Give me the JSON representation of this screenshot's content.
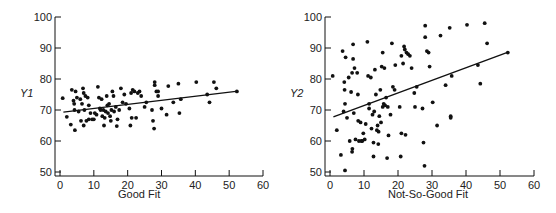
{
  "chart_data": [
    {
      "type": "scatter",
      "title": "",
      "xlabel": "Good Fit",
      "ylabel": "Y1",
      "xlim": [
        0,
        60
      ],
      "ylim": [
        50,
        100
      ],
      "xticks": [
        0,
        10,
        20,
        30,
        40,
        50,
        60
      ],
      "yticks": [
        50,
        60,
        70,
        80,
        90,
        100
      ],
      "grid": false,
      "legend": null,
      "fit_line": {
        "x": [
          1,
          52
        ],
        "y": [
          69.3,
          76
        ]
      },
      "points": [
        [
          0.8,
          73.8
        ],
        [
          2,
          67.8
        ],
        [
          3.2,
          65.3
        ],
        [
          3.5,
          76.5
        ],
        [
          4,
          73
        ],
        [
          4.2,
          72
        ],
        [
          4.3,
          70
        ],
        [
          4.4,
          63.5
        ],
        [
          4.6,
          76
        ],
        [
          5,
          74
        ],
        [
          5.5,
          69.5
        ],
        [
          6,
          73.5
        ],
        [
          6.2,
          66.5
        ],
        [
          6.5,
          72
        ],
        [
          6.8,
          77
        ],
        [
          7,
          75.5
        ],
        [
          7,
          65
        ],
        [
          7.2,
          70
        ],
        [
          7.5,
          74.5
        ],
        [
          7.8,
          66.5
        ],
        [
          8.2,
          74
        ],
        [
          8.5,
          71.5
        ],
        [
          8.5,
          67
        ],
        [
          9,
          69
        ],
        [
          9.5,
          67
        ],
        [
          10,
          67
        ],
        [
          10.3,
          69
        ],
        [
          10.8,
          68.5
        ],
        [
          11.2,
          77.5
        ],
        [
          11.5,
          74
        ],
        [
          11.8,
          70.5
        ],
        [
          12,
          70
        ],
        [
          12.3,
          73.5
        ],
        [
          12.5,
          68
        ],
        [
          12.8,
          70
        ],
        [
          13,
          65
        ],
        [
          13.2,
          67.5
        ],
        [
          13.5,
          69.5
        ],
        [
          13.8,
          74.5
        ],
        [
          14,
          71.5
        ],
        [
          14.2,
          69
        ],
        [
          14.5,
          72
        ],
        [
          14.8,
          68
        ],
        [
          15,
          66.5
        ],
        [
          15.2,
          70
        ],
        [
          15.5,
          76
        ],
        [
          15.8,
          74.5
        ],
        [
          16,
          69.5
        ],
        [
          16.5,
          71
        ],
        [
          16.8,
          64.8
        ],
        [
          17,
          67
        ],
        [
          17.5,
          70
        ],
        [
          18,
          77
        ],
        [
          18.5,
          72.5
        ],
        [
          19,
          75
        ],
        [
          19.5,
          72
        ],
        [
          20.5,
          70.5
        ],
        [
          20.8,
          65
        ],
        [
          21,
          75.5
        ],
        [
          21.2,
          67.5
        ],
        [
          21.5,
          76.5
        ],
        [
          22,
          76
        ],
        [
          22.5,
          67.5
        ],
        [
          23,
          75.5
        ],
        [
          23.5,
          76
        ],
        [
          24,
          74.5
        ],
        [
          25,
          71
        ],
        [
          25.5,
          72.5
        ],
        [
          27.2,
          70
        ],
        [
          27.5,
          66.5
        ],
        [
          27.8,
          64
        ],
        [
          28,
          79
        ],
        [
          28,
          78
        ],
        [
          28.5,
          76
        ],
        [
          29,
          74.5
        ],
        [
          29,
          76
        ],
        [
          30,
          70.5
        ],
        [
          31.5,
          68.5
        ],
        [
          32,
          77.7
        ],
        [
          33.5,
          72.5
        ],
        [
          35,
          78.5
        ],
        [
          35.3,
          69
        ],
        [
          35.7,
          73.5
        ],
        [
          40.3,
          79
        ],
        [
          43.5,
          75
        ],
        [
          44.2,
          72.5
        ],
        [
          45.5,
          79
        ],
        [
          46.2,
          77
        ],
        [
          52.3,
          76
        ]
      ]
    },
    {
      "type": "scatter",
      "title": "",
      "xlabel": "Not-So-Good Fit",
      "ylabel": "Y2",
      "xlim": [
        0,
        60
      ],
      "ylim": [
        50,
        100
      ],
      "xticks": [
        0,
        10,
        20,
        30,
        40,
        50,
        60
      ],
      "yticks": [
        50,
        60,
        70,
        80,
        90,
        100
      ],
      "grid": false,
      "legend": null,
      "fit_line": {
        "x": [
          1,
          52
        ],
        "y": [
          67.8,
          88.5
        ]
      },
      "points": [
        [
          0.8,
          81
        ],
        [
          2,
          63.5
        ],
        [
          3.2,
          55.5
        ],
        [
          3.7,
          89
        ],
        [
          4,
          69.5
        ],
        [
          4.2,
          79
        ],
        [
          4.3,
          76.5
        ],
        [
          4.4,
          72
        ],
        [
          4.4,
          50.5
        ],
        [
          4.6,
          87
        ],
        [
          5,
          67.5
        ],
        [
          5.5,
          80.5
        ],
        [
          5.8,
          60
        ],
        [
          6.2,
          75.8
        ],
        [
          6.5,
          82
        ],
        [
          6.5,
          56.5
        ],
        [
          6.6,
          57.5
        ],
        [
          6.8,
          91.2
        ],
        [
          6.8,
          86.5
        ],
        [
          7,
          69
        ],
        [
          7.2,
          83.5
        ],
        [
          7.5,
          60.5
        ],
        [
          8,
          82
        ],
        [
          8.2,
          75
        ],
        [
          8.3,
          66.5
        ],
        [
          8.5,
          60
        ],
        [
          9,
          66
        ],
        [
          9.2,
          60
        ],
        [
          9.5,
          60
        ],
        [
          9.8,
          62.5
        ],
        [
          10.2,
          60.5
        ],
        [
          10.5,
          65.5
        ],
        [
          11,
          92
        ],
        [
          11.2,
          81
        ],
        [
          11.5,
          72
        ],
        [
          11.5,
          70.5
        ],
        [
          12,
          80.5
        ],
        [
          12.2,
          64
        ],
        [
          12.5,
          68.5
        ],
        [
          12.8,
          59.5
        ],
        [
          12.8,
          55
        ],
        [
          13,
          69.5
        ],
        [
          13.2,
          83
        ],
        [
          13.5,
          75
        ],
        [
          13.8,
          63.5
        ],
        [
          14,
          65
        ],
        [
          14.2,
          59
        ],
        [
          14.3,
          63
        ],
        [
          14.5,
          68
        ],
        [
          14.8,
          76.5
        ],
        [
          15,
          66
        ],
        [
          15.2,
          84
        ],
        [
          15.5,
          88.5
        ],
        [
          15.5,
          71
        ],
        [
          15.8,
          72
        ],
        [
          16,
          83.5
        ],
        [
          16.2,
          71.5
        ],
        [
          16.5,
          74
        ],
        [
          16.8,
          54.5
        ],
        [
          17,
          71
        ],
        [
          17.2,
          61.8
        ],
        [
          17.8,
          68.5
        ],
        [
          18.2,
          91.5
        ],
        [
          18.5,
          77.5
        ],
        [
          19,
          76.5
        ],
        [
          19.2,
          84.5
        ],
        [
          20.5,
          71
        ],
        [
          20.8,
          55
        ],
        [
          21,
          87.5
        ],
        [
          21,
          62.5
        ],
        [
          21.5,
          85
        ],
        [
          21.8,
          90.5
        ],
        [
          22,
          89.5
        ],
        [
          22.2,
          62
        ],
        [
          22.5,
          88.5
        ],
        [
          23,
          88
        ],
        [
          23.5,
          87.5
        ],
        [
          24,
          83.5
        ],
        [
          24.8,
          75.5
        ],
        [
          25,
          71
        ],
        [
          25.5,
          77.5
        ],
        [
          27.2,
          70.5
        ],
        [
          27.5,
          59.5
        ],
        [
          27.8,
          52
        ],
        [
          28,
          97.2
        ],
        [
          28,
          93.5
        ],
        [
          28.5,
          89
        ],
        [
          29,
          88.5
        ],
        [
          29.3,
          84
        ],
        [
          30.2,
          72.5
        ],
        [
          31.5,
          65
        ],
        [
          32.5,
          94
        ],
        [
          34,
          78
        ],
        [
          35.2,
          96.5
        ],
        [
          35.5,
          68
        ],
        [
          35.5,
          67.5
        ],
        [
          35.8,
          81
        ],
        [
          40.3,
          97.5
        ],
        [
          43.5,
          84.5
        ],
        [
          44.2,
          78.5
        ],
        [
          45.5,
          98
        ],
        [
          46.2,
          91.5
        ],
        [
          52.3,
          88.5
        ]
      ]
    }
  ],
  "charts": [
    {
      "xlabel": "Good Fit",
      "ylabel": "Y1",
      "xtick_labels": [
        "0",
        "10",
        "20",
        "30",
        "40",
        "50",
        "60"
      ],
      "ytick_labels": [
        "50",
        "60",
        "70",
        "80",
        "90",
        "100"
      ]
    },
    {
      "xlabel": "Not-So-Good Fit",
      "ylabel": "Y2",
      "xtick_labels": [
        "0",
        "10",
        "20",
        "30",
        "40",
        "50",
        "60"
      ],
      "ytick_labels": [
        "50",
        "60",
        "70",
        "80",
        "90",
        "100"
      ]
    }
  ],
  "colors": {
    "ink": "#111111",
    "axis": "#222222",
    "background": "#ffffff"
  }
}
